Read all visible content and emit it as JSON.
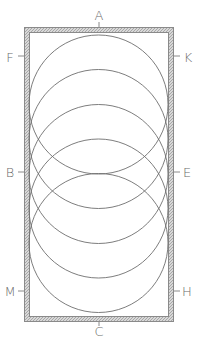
{
  "figure": {
    "type": "geometric-construction",
    "colors": {
      "background": "#ffffff",
      "frame_outer": "#8a8a8a",
      "frame_hatch": "#b5b5b5",
      "circle_stroke": "#6e6e6e",
      "label_text": "#6a6a6a"
    },
    "frame": {
      "x": 24,
      "y": 27,
      "width": 150,
      "height": 295,
      "thickness": 5
    },
    "circles": [
      {
        "cx": 98.5,
        "cy": 104.5,
        "r": 69.5
      },
      {
        "cx": 98.5,
        "cy": 139,
        "r": 69.5
      },
      {
        "cx": 98.5,
        "cy": 174,
        "r": 69.5
      },
      {
        "cx": 98.5,
        "cy": 208.5,
        "r": 69.5
      },
      {
        "cx": 98.5,
        "cy": 243,
        "r": 69.5
      }
    ],
    "labels": {
      "top": {
        "text": "A",
        "x": 99,
        "y": 15
      },
      "bottom": {
        "text": "C",
        "x": 99,
        "y": 331
      },
      "left_upper": {
        "text": "F",
        "x": 10,
        "y": 57
      },
      "left_middle": {
        "text": "B",
        "x": 10,
        "y": 172
      },
      "left_lower": {
        "text": "M",
        "x": 10,
        "y": 291
      },
      "right_upper": {
        "text": "K",
        "x": 188,
        "y": 57
      },
      "right_middle": {
        "text": "E",
        "x": 187,
        "y": 172
      },
      "right_lower": {
        "text": "H",
        "x": 187,
        "y": 291
      }
    },
    "ticks": [
      {
        "x1": 99,
        "y1": 22,
        "x2": 99,
        "y2": 28
      },
      {
        "x1": 99,
        "y1": 321,
        "x2": 99,
        "y2": 326
      },
      {
        "x1": 18,
        "y1": 56,
        "x2": 25,
        "y2": 56
      },
      {
        "x1": 18,
        "y1": 172,
        "x2": 25,
        "y2": 172
      },
      {
        "x1": 18,
        "y1": 291,
        "x2": 25,
        "y2": 291
      },
      {
        "x1": 173,
        "y1": 56,
        "x2": 180,
        "y2": 56
      },
      {
        "x1": 173,
        "y1": 172,
        "x2": 180,
        "y2": 172
      },
      {
        "x1": 173,
        "y1": 291,
        "x2": 180,
        "y2": 291
      }
    ]
  }
}
